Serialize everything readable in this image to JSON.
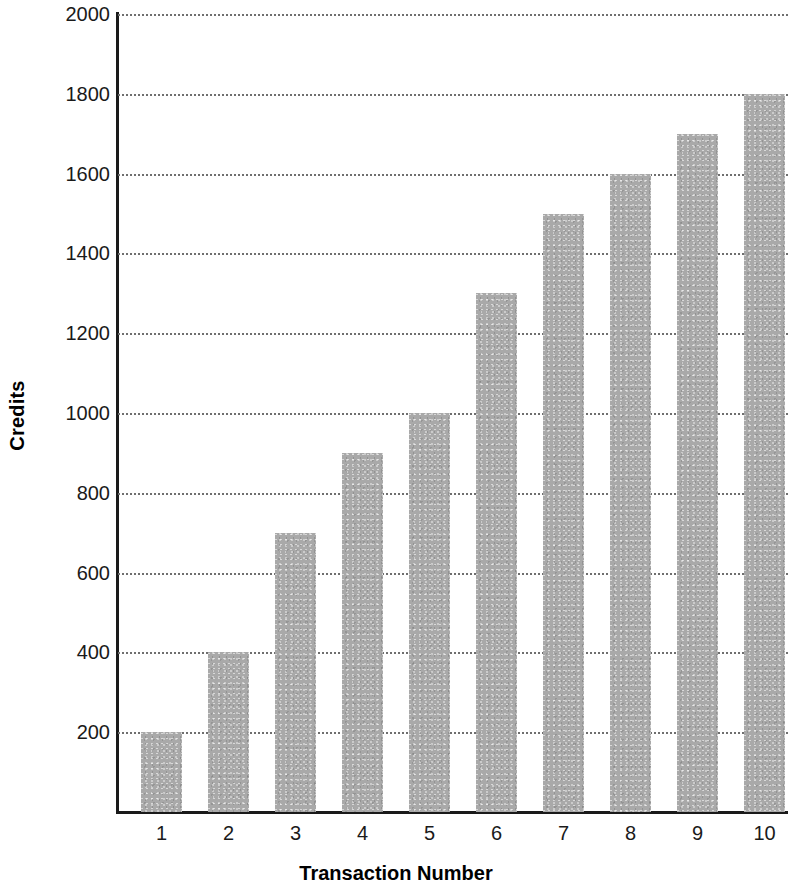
{
  "chart_data": {
    "type": "bar",
    "title": "",
    "xlabel": "Transaction Number",
    "ylabel": "Credits",
    "categories": [
      "1",
      "2",
      "3",
      "4",
      "5",
      "6",
      "7",
      "8",
      "9",
      "10"
    ],
    "values": [
      200,
      400,
      700,
      900,
      1000,
      1300,
      1500,
      1600,
      1700,
      1800
    ],
    "series": [
      {
        "name": "Credits",
        "values": [
          200,
          400,
          700,
          900,
          1000,
          1300,
          1500,
          1600,
          1700,
          1800
        ]
      }
    ],
    "ylim": [
      0,
      2000
    ],
    "ytick_values": [
      200,
      400,
      600,
      800,
      1000,
      1200,
      1400,
      1600,
      1800,
      2000
    ],
    "ytick_labels": [
      "200",
      "400",
      "600",
      "800",
      "1000",
      "1200",
      "1400",
      "1600",
      "1800",
      "2000"
    ],
    "ytick_interval": 200,
    "grid": true,
    "grid_style": "dotted",
    "grid_axis": "y",
    "legend": false,
    "legend_position": "none",
    "bar_color": "#a9a9a9",
    "grid_color": "#6f6f6f",
    "axis_color": "#1a1a1a",
    "text_color": "#1a1a1a"
  }
}
